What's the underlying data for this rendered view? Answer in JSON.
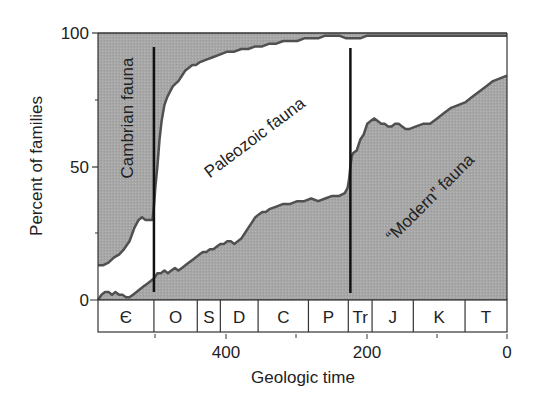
{
  "chart_data": {
    "type": "area",
    "title": "",
    "xlabel": "Geologic time",
    "ylabel": "Percent of families",
    "xlim": [
      585,
      0
    ],
    "ylim": [
      0,
      100
    ],
    "x_ticks": [
      400,
      200,
      0
    ],
    "y_ticks": [
      0,
      50,
      100
    ],
    "grid": false,
    "legend": "none (labels inside areas)",
    "periods": [
      {
        "label": "Є",
        "start": 585,
        "end": 505
      },
      {
        "label": "O",
        "start": 505,
        "end": 443
      },
      {
        "label": "S",
        "start": 443,
        "end": 410
      },
      {
        "label": "D",
        "start": 410,
        "end": 356
      },
      {
        "label": "C",
        "start": 356,
        "end": 284
      },
      {
        "label": "P",
        "start": 284,
        "end": 227
      },
      {
        "label": "Tr",
        "start": 227,
        "end": 193
      },
      {
        "label": "J",
        "start": 193,
        "end": 134
      },
      {
        "label": "K",
        "start": 134,
        "end": 60
      },
      {
        "label": "T",
        "start": 60,
        "end": 0
      }
    ],
    "extinction_lines": [
      {
        "time": 505,
        "label": "end-Cambrian"
      },
      {
        "time": 224,
        "label": "end-Permian"
      }
    ],
    "series": [
      {
        "name": "Cambrian fauna",
        "description": "upper boundary of stacked area (Cambrian fauna fills from this line to 100%)",
        "x": [
          585,
          578,
          570,
          562,
          555,
          548,
          540,
          533,
          527,
          522,
          517,
          512,
          507,
          505,
          503,
          500,
          497,
          494,
          490,
          486,
          482,
          478,
          474,
          470,
          465,
          460,
          455,
          450,
          445,
          440,
          430,
          420,
          410,
          400,
          390,
          380,
          370,
          360,
          350,
          340,
          330,
          320,
          310,
          300,
          290,
          280,
          270,
          260,
          250,
          240,
          230,
          224,
          220,
          210,
          200,
          180,
          160,
          140,
          120,
          100,
          80,
          60,
          40,
          20,
          0
        ],
        "values": [
          13,
          13,
          14,
          16,
          17,
          19,
          22,
          27,
          30,
          31,
          30,
          30,
          30,
          35,
          42,
          50,
          60,
          67,
          73,
          76,
          78,
          80,
          81,
          82,
          84,
          86,
          87,
          88,
          88,
          89,
          90,
          91,
          92,
          93,
          93,
          94,
          94,
          95,
          95,
          96,
          96,
          97,
          97,
          97,
          98,
          98,
          98,
          99,
          99,
          99,
          98,
          98,
          98,
          98,
          99,
          99,
          99,
          99,
          99,
          99,
          99,
          99,
          99,
          99,
          99
        ]
      },
      {
        "name": "Modern fauna",
        "description": "lower stacked area (Modern fauna fills from 0% up to this line)",
        "x": [
          585,
          580,
          575,
          570,
          565,
          560,
          555,
          550,
          545,
          540,
          535,
          530,
          525,
          520,
          515,
          510,
          505,
          500,
          495,
          490,
          485,
          480,
          475,
          470,
          465,
          460,
          455,
          450,
          445,
          440,
          435,
          430,
          425,
          420,
          415,
          410,
          405,
          400,
          395,
          390,
          385,
          380,
          375,
          370,
          365,
          360,
          355,
          350,
          345,
          340,
          330,
          320,
          310,
          300,
          290,
          280,
          270,
          260,
          250,
          240,
          232,
          228,
          226,
          224,
          222,
          220,
          215,
          210,
          205,
          200,
          195,
          190,
          185,
          180,
          175,
          170,
          165,
          160,
          155,
          150,
          145,
          140,
          130,
          120,
          110,
          100,
          90,
          80,
          70,
          60,
          50,
          40,
          30,
          20,
          10,
          0
        ],
        "values": [
          0,
          2,
          3,
          3,
          2,
          3,
          2,
          2,
          1,
          1,
          2,
          3,
          4,
          5,
          6,
          7,
          8,
          10,
          10,
          11,
          10,
          11,
          12,
          11,
          12,
          13,
          14,
          15,
          16,
          17,
          18,
          18,
          19,
          19,
          20,
          21,
          21,
          22,
          22,
          21,
          22,
          23,
          25,
          27,
          29,
          31,
          32,
          33,
          33,
          34,
          35,
          36,
          36,
          37,
          37,
          38,
          37,
          38,
          39,
          39,
          40,
          42,
          45,
          50,
          54,
          55,
          56,
          60,
          62,
          66,
          67,
          68,
          67,
          66,
          66,
          65,
          65,
          66,
          66,
          65,
          64,
          64,
          65,
          66,
          66,
          68,
          70,
          72,
          73,
          74,
          76,
          78,
          80,
          82,
          83,
          84
        ]
      }
    ],
    "annotations": [
      {
        "text": "Cambrian fauna",
        "rotation": -90
      },
      {
        "text": "Paleozoic fauna",
        "rotation": -37
      },
      {
        "text": "“Modern” fauna",
        "rotation": -45
      }
    ],
    "colors": {
      "fill": "#a9a9a9",
      "line": "#555555",
      "axis": "#333333",
      "extinction_line": "#111111",
      "background": "#ffffff"
    }
  },
  "labels": {
    "xlabel": "Geologic time",
    "ylabel": "Percent of families",
    "x_ticks": [
      "400",
      "200",
      "0"
    ],
    "y_ticks": [
      "100",
      "50",
      "0"
    ],
    "cambrian": "Cambrian fauna",
    "paleozoic": "Paleozoic fauna",
    "modern": "“Modern” fauna"
  }
}
